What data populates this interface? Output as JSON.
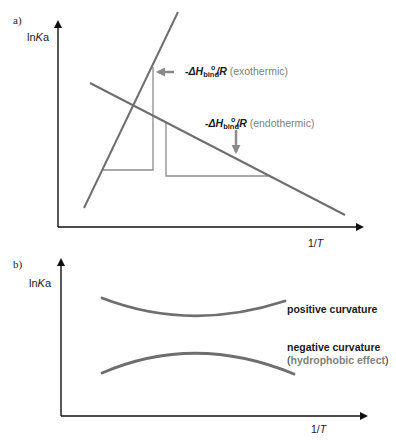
{
  "panel_a": {
    "label": "a)",
    "y_axis": {
      "prefix": "ln",
      "var": "K",
      "sub": "a"
    },
    "x_axis": {
      "prefix": "1/",
      "var": "T"
    },
    "annotations": [
      {
        "pre": "-",
        "delta": "ΔH",
        "sup": "o",
        "sub": "bind",
        "post": "/R",
        "note": "(exothermic)"
      },
      {
        "pre": "-",
        "delta": "ΔH",
        "sup": "o",
        "sub": "bind",
        "post": "/R",
        "note": "(endothermic)"
      }
    ],
    "lines": [
      {
        "name": "exothermic-line",
        "x1": 84,
        "y1": 208,
        "x2": 178,
        "y2": 12,
        "color": "#6e6e6e"
      },
      {
        "name": "endothermic-line",
        "x1": 90,
        "y1": 83,
        "x2": 345,
        "y2": 215,
        "color": "#6e6e6e"
      }
    ],
    "slope_triangles": [
      {
        "name": "exothermic-slope-triangle",
        "points": "153,67 153,170 103,170",
        "color": "#8c8c8c"
      },
      {
        "name": "endothermic-slope-triangle",
        "points": "166,123 166,176 268,176",
        "color": "#8c8c8c"
      }
    ]
  },
  "panel_b": {
    "label": "b)",
    "y_axis": {
      "prefix": "ln",
      "var": "K",
      "sub": "a"
    },
    "x_axis": {
      "prefix": "1/",
      "var": "T"
    },
    "curves": [
      {
        "name": "positive-curvature-curve",
        "label": "positive curvature"
      },
      {
        "name": "negative-curvature-curve",
        "label": "negative curvature",
        "note": "hydrophobic effect"
      }
    ]
  },
  "colors": {
    "axis": "#111111",
    "line": "#6e6e6e",
    "guide": "#8c8c8c",
    "arrow": "#8a8a8a",
    "note_text": "#808080"
  }
}
